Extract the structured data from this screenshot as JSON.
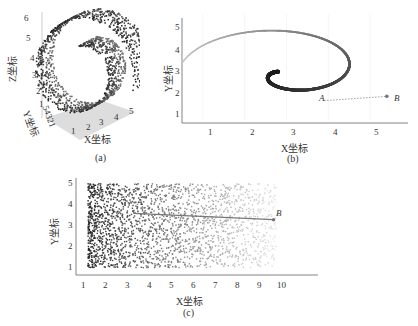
{
  "chart_data": [
    {
      "id": "a",
      "type": "scatter",
      "subtype": "3d-swiss-roll",
      "caption": "(a)",
      "xlabel": "X坐标",
      "ylabel": "Y坐标",
      "zlabel": "Z坐标",
      "x_ticks": [
        "1",
        "2",
        "3",
        "4",
        "5"
      ],
      "y_ticks": [
        "1",
        "2",
        "3",
        "4",
        "5"
      ],
      "y_ticks_text": "54321",
      "z_ticks": [
        "1",
        "2",
        "3",
        "4",
        "5",
        "6"
      ],
      "xlim": [
        1,
        5
      ],
      "ylim": [
        1,
        5
      ],
      "zlim": [
        1,
        6
      ],
      "description": "3D Swiss-roll point cloud, spiral in X-Z plane extruded along Y"
    },
    {
      "id": "b",
      "type": "scatter",
      "subtype": "spiral",
      "caption": "(b)",
      "xlabel": "X坐标",
      "ylabel": "Y坐标",
      "x_ticks": [
        "1",
        "2",
        "3",
        "4",
        "5"
      ],
      "y_ticks": [
        "1",
        "2",
        "3",
        "4",
        "5"
      ],
      "xlim": [
        0.5,
        5.6
      ],
      "ylim": [
        0.7,
        5.3
      ],
      "grid": true,
      "annotations": [
        {
          "label": "A",
          "x": 3.9,
          "y": 1.6
        },
        {
          "label": "B",
          "x": 5.4,
          "y": 1.8
        }
      ],
      "spiral_start": {
        "x": 1.95,
        "y": 3.25
      },
      "spiral_end": {
        "x": 5.4,
        "y": 1.8
      },
      "connector": {
        "from": "A",
        "to": "B",
        "style": "dotted"
      }
    },
    {
      "id": "c",
      "type": "scatter",
      "subtype": "unrolled",
      "caption": "(c)",
      "xlabel": "X坐标",
      "ylabel": "Y坐标",
      "x_ticks": [
        "1",
        "2",
        "3",
        "4",
        "5",
        "6",
        "7",
        "8",
        "9",
        "10"
      ],
      "y_ticks": [
        "1",
        "2",
        "3",
        "4",
        "5"
      ],
      "xlim": [
        1,
        10
      ],
      "ylim": [
        1,
        5
      ],
      "annotations": [
        {
          "label": "A",
          "x": 3.3,
          "y": 3.6
        },
        {
          "label": "B",
          "x": 9.7,
          "y": 3.3
        }
      ],
      "connector": {
        "from": "A",
        "to": "B",
        "style": "solid"
      },
      "description": "Unrolled manifold; point density fades from dark (x≈1) to light (x≈10)"
    }
  ]
}
